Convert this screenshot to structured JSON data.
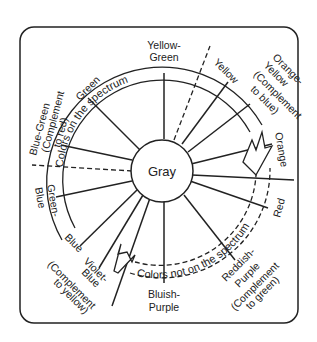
{
  "diagram": {
    "center_label": "Gray",
    "ring_top_label": "Colors on the spectrum",
    "ring_bottom_label": "Colors not on the spectrum",
    "hues": [
      {
        "id": "yellow-green",
        "lines": [
          "Yellow-",
          "Green"
        ]
      },
      {
        "id": "yellow",
        "lines": [
          "Yellow"
        ]
      },
      {
        "id": "orange-yellow",
        "lines": [
          "Orange-",
          "Yellow",
          "(Complement",
          "to blue)"
        ]
      },
      {
        "id": "orange",
        "lines": [
          "Orange"
        ]
      },
      {
        "id": "red",
        "lines": [
          "Red"
        ]
      },
      {
        "id": "reddish-purple",
        "lines": [
          "Reddish-",
          "Purple",
          "(Complement",
          "to green)"
        ]
      },
      {
        "id": "bluish-purple",
        "lines": [
          "Bluish-",
          "Purple"
        ]
      },
      {
        "id": "violet-blue",
        "lines": [
          "Violet-",
          "Blue",
          "(Complement",
          "to yellow)"
        ]
      },
      {
        "id": "blue",
        "lines": [
          "Blue"
        ]
      },
      {
        "id": "green-blue",
        "lines": [
          "Green-",
          "Blue"
        ]
      },
      {
        "id": "blue-green",
        "lines": [
          "Blue-Green",
          "(Complement",
          "to red)"
        ]
      },
      {
        "id": "green",
        "lines": [
          "Green"
        ]
      }
    ],
    "colors": {
      "line": "#222222",
      "background": "#ffffff"
    }
  }
}
